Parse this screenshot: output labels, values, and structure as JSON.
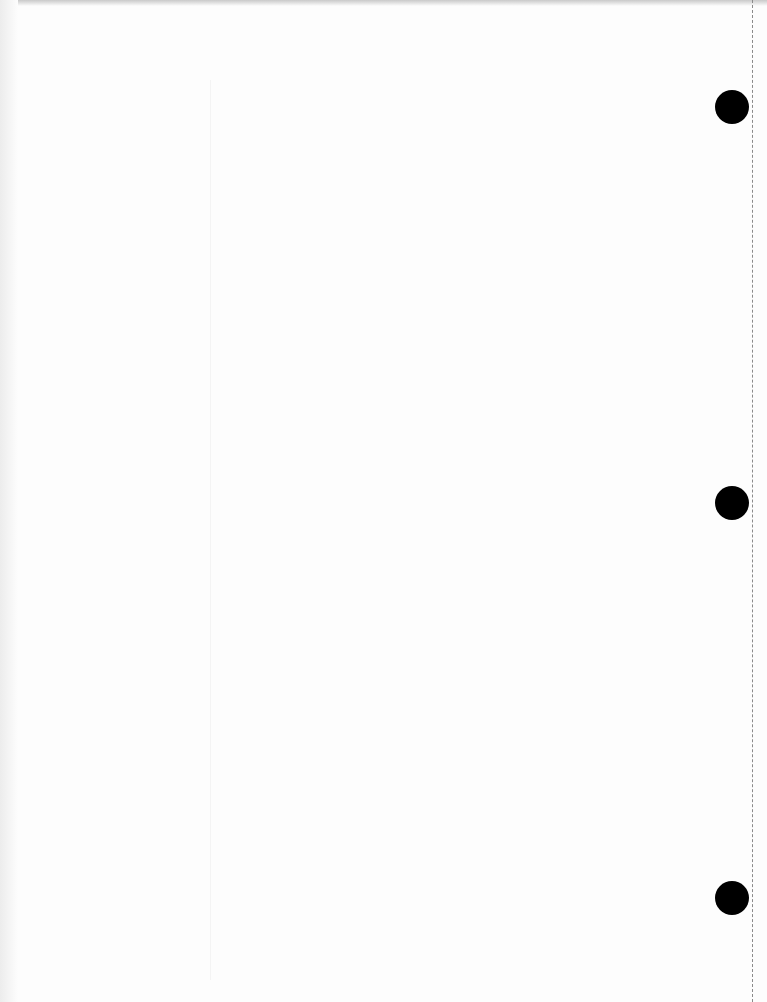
{
  "document": {
    "type": "blank loose-leaf sheet",
    "content_text": "",
    "punch_holes": [
      {
        "x": 732,
        "y": 107
      },
      {
        "x": 732,
        "y": 503
      },
      {
        "x": 732,
        "y": 898
      }
    ],
    "colors": {
      "paper": "#fdfdfd",
      "hole": "#000000",
      "perforation": "#8a8a8a"
    }
  }
}
